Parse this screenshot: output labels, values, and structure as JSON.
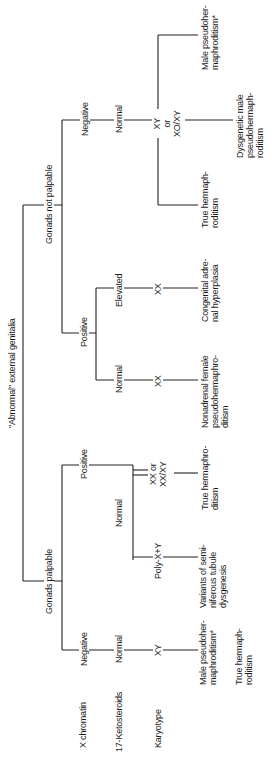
{
  "diagram": {
    "orientation": "rotated 90 degrees counter-clockwise",
    "root": "\"Abnormal\" external genitalia",
    "row_headers": {
      "x_chromatin": "X chromatin",
      "ketosteroids": "17-Ketosteroids",
      "karyotype": "Karyotype"
    },
    "branches": {
      "gonads_palpable": {
        "label": "Gonads palpable",
        "negative": {
          "x_chromatin": "Negative",
          "ketosteroids": "Normal",
          "karyotype": "XY",
          "outcomes": [
            "Male pseudoher-\nmaphroditism*",
            "True hermaph-\nroditism"
          ]
        },
        "positive": {
          "x_chromatin": "Positive",
          "ketosteroids": "Normal",
          "karyotype_a": "Poly-X+Y",
          "outcome_a": "Variants of semi-\nniferous tubule\ndysgenesis",
          "karyotype_b": "XX or\nXX/XY",
          "outcome_b": "True hermaphro-\nditism"
        }
      },
      "gonads_not_palpable": {
        "label": "Gonads not palpable",
        "positive": {
          "x_chromatin": "Positive",
          "normal": {
            "ketosteroids": "Normal",
            "karyotype": "XX",
            "outcome": "Nonadrenal female\npseudohermaphro-\nditism"
          },
          "elevated": {
            "ketosteroids": "Elevated",
            "karyotype": "XX",
            "outcome": "Congenital adre-\nnal hyperplasia"
          }
        },
        "negative": {
          "x_chromatin": "Negative",
          "ketosteroids": "Normal",
          "karyotype": "XY\nor\nXO/XY",
          "outcomes": [
            "True hermaph-\nroditism",
            "Dysgenetic male\npseudohermaph-\nroditism",
            "Male pseudoher-\nmaphroditism*"
          ]
        }
      }
    }
  }
}
